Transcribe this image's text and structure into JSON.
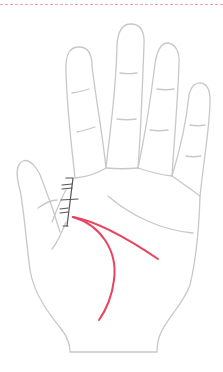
{
  "diagram": {
    "hand": "right-palm-open",
    "colors": {
      "divider": "#f2a7b8",
      "outline": "#c8c8c8",
      "marks": "#555555",
      "highlight": "#e8435f",
      "background": "#ffffff"
    },
    "highlighted_lines": [
      {
        "name": "life-line",
        "color": "#e8435f"
      },
      {
        "name": "head-line",
        "color": "#e8435f"
      }
    ],
    "marks": {
      "name": "cross-hatch-marks",
      "count": 3,
      "color": "#555555"
    }
  }
}
